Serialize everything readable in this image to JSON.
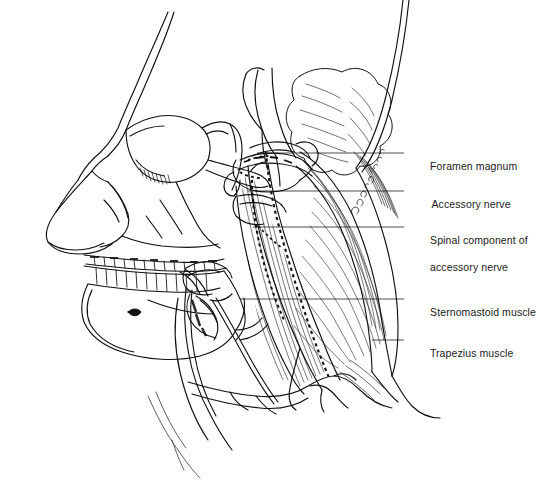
{
  "figure": {
    "background_color": "#ffffff",
    "ink_color": "#111111",
    "width": 545,
    "height": 482
  },
  "labels": [
    {
      "id": "foramen-magnum",
      "text": "Foramen magnum",
      "x": 418,
      "y": 148,
      "leader": {
        "x1": 404,
        "y1": 153,
        "x2": 257,
        "y2": 153
      }
    },
    {
      "id": "accessory-nerve",
      "text": "Accessory nerve",
      "x": 420,
      "y": 186,
      "leader": {
        "x1": 404,
        "y1": 191,
        "x2": 248,
        "y2": 191
      }
    },
    {
      "id": "spinal-component",
      "text": "Spinal component of",
      "text2": "accessory nerve",
      "x": 418,
      "y": 222,
      "leader": {
        "x1": 404,
        "y1": 227,
        "x2": 253,
        "y2": 227
      }
    },
    {
      "id": "sternomastoid-muscle",
      "text": "Sternomastoid muscle",
      "x": 418,
      "y": 294,
      "leader": {
        "x1": 404,
        "y1": 299,
        "x2": 240,
        "y2": 299
      }
    },
    {
      "id": "trapezius-muscle",
      "text": "Trapezius muscle",
      "x": 418,
      "y": 335,
      "leader": {
        "x1": 404,
        "y1": 340,
        "x2": 372,
        "y2": 340
      }
    }
  ],
  "annotation": {
    "signature_text": "artist mark",
    "x": 352,
    "y": 200
  },
  "structures": [
    "lateral skull",
    "nasal bones",
    "orbit",
    "zygomatic arch",
    "maxilla with teeth",
    "mandible with teeth",
    "mental foramen",
    "cerebellum",
    "brainstem",
    "atlas vertebra",
    "hyoid bone",
    "sternomastoid muscle",
    "trapezius muscle",
    "clavicle",
    "accessory nerve dotted path",
    "spinal component dotted path"
  ]
}
